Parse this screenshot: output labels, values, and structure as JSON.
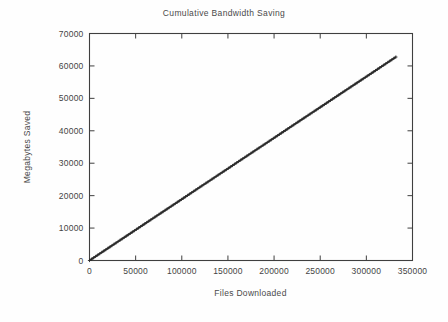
{
  "figure": {
    "background_color": "#fefefe",
    "ink_color": "#3f3f3f",
    "line_color": "#2b2b2b"
  },
  "chart_data": {
    "type": "line",
    "title": "Cumulative Bandwidth Saving",
    "subtitle": "",
    "xlabel": "Files Downloaded",
    "ylabel": "Megabytes Saved",
    "xlim": [
      0,
      350000
    ],
    "ylim": [
      0,
      70000
    ],
    "grid": false,
    "legend_position": "none",
    "marker": "plus",
    "xticks": [
      0,
      50000,
      100000,
      150000,
      200000,
      250000,
      300000,
      350000
    ],
    "xtick_labels": [
      "0",
      "50000",
      "100000",
      "150000",
      "200000",
      "250000",
      "300000",
      "350000"
    ],
    "yticks": [
      0,
      10000,
      20000,
      30000,
      40000,
      50000,
      60000,
      70000
    ],
    "ytick_labels": [
      "0",
      "10000",
      "20000",
      "30000",
      "40000",
      "50000",
      "60000",
      "70000"
    ],
    "series": [
      {
        "name": "Cumulative megabytes saved",
        "x": [
          0,
          10000,
          20000,
          30000,
          40000,
          50000,
          60000,
          70000,
          80000,
          90000,
          100000,
          110000,
          120000,
          130000,
          140000,
          150000,
          160000,
          170000,
          180000,
          190000,
          200000,
          210000,
          220000,
          230000,
          240000,
          250000,
          260000,
          270000,
          280000,
          290000,
          300000,
          310000,
          320000,
          332000
        ],
        "values": [
          0,
          1890,
          3780,
          5670,
          7560,
          9450,
          11340,
          13230,
          15120,
          17010,
          18900,
          20790,
          22680,
          24570,
          26460,
          28350,
          30240,
          32130,
          34020,
          35910,
          37800,
          39690,
          41580,
          43470,
          45360,
          47250,
          49140,
          51030,
          52920,
          54810,
          56700,
          58590,
          60480,
          62750
        ]
      }
    ],
    "annotations": []
  }
}
